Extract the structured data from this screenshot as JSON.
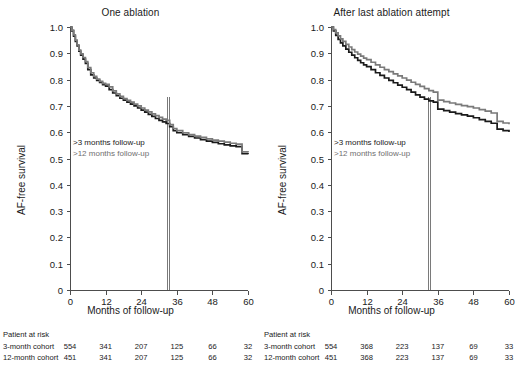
{
  "figure": {
    "width": 522,
    "height": 374,
    "background": "#ffffff",
    "series_colors": {
      "cohort_3month": "#1a1a1a",
      "cohort_12month": "#7a7a7a"
    }
  },
  "chart_data": [
    {
      "type": "line",
      "panel_id": "one-ablation",
      "title": "One ablation",
      "xlabel": "Months of follow-up",
      "ylabel": "AF-free survival",
      "xlim": [
        0,
        60
      ],
      "ylim": [
        0,
        1.0
      ],
      "grid": false,
      "legend_position": "inside-left",
      "xticks": [
        0,
        12,
        24,
        36,
        48,
        60
      ],
      "xticklabels": [
        "0",
        "12",
        "24",
        "36",
        "48",
        "60"
      ],
      "yticks": [
        0,
        0.1,
        0.2,
        0.3,
        0.4,
        0.5,
        0.6,
        0.7,
        0.8,
        0.9,
        1.0
      ],
      "yticklabels": [
        "0",
        "0.1",
        "0.2",
        "0.3",
        "0.4",
        "0.5",
        "0.6",
        "0.7",
        "0.8",
        "0.9",
        "1.0"
      ],
      "annotations": [
        {
          "label": ">3 months follow-up",
          "color": "#1a1a1a"
        },
        {
          "label": ">12 months follow-up",
          "color": "#6f6f6f"
        }
      ],
      "reference_lines": [
        {
          "x": 32.6,
          "color": "#7a7a7a"
        },
        {
          "x": 33.4,
          "color": "#7a7a7a"
        }
      ],
      "series": [
        {
          "name": ">3 months follow-up",
          "color": "#1a1a1a",
          "x": [
            0,
            0.6,
            1.2,
            1.8,
            2.4,
            3.0,
            3.6,
            4.4,
            5.2,
            6.0,
            7.0,
            8.0,
            9.0,
            10.0,
            11.0,
            12.0,
            13.2,
            14.4,
            15.6,
            16.8,
            18.0,
            19.2,
            20.4,
            21.6,
            22.8,
            24.0,
            25.2,
            26.4,
            27.6,
            28.8,
            30.0,
            31.2,
            32.4,
            33.6,
            34.8,
            36.0,
            38.0,
            40.0,
            42.0,
            44.0,
            46.0,
            48.0,
            50.0,
            52.0,
            54.0,
            56.0,
            58.0,
            60.0
          ],
          "y": [
            1.0,
            0.985,
            0.965,
            0.945,
            0.928,
            0.908,
            0.893,
            0.878,
            0.862,
            0.838,
            0.818,
            0.806,
            0.797,
            0.789,
            0.781,
            0.775,
            0.762,
            0.749,
            0.739,
            0.729,
            0.722,
            0.714,
            0.707,
            0.7,
            0.692,
            0.684,
            0.676,
            0.668,
            0.66,
            0.652,
            0.645,
            0.639,
            0.633,
            0.621,
            0.606,
            0.598,
            0.591,
            0.584,
            0.578,
            0.572,
            0.566,
            0.561,
            0.556,
            0.552,
            0.548,
            0.545,
            0.518,
            0.516
          ]
        },
        {
          "name": ">12 months follow-up",
          "color": "#7a7a7a",
          "x": [
            0,
            0.6,
            1.2,
            1.8,
            2.4,
            3.0,
            3.6,
            4.4,
            5.2,
            6.0,
            7.0,
            8.0,
            9.0,
            10.0,
            11.0,
            12.0,
            13.2,
            14.4,
            15.6,
            16.8,
            18.0,
            19.2,
            20.4,
            21.6,
            22.8,
            24.0,
            25.2,
            26.4,
            27.6,
            28.8,
            30.0,
            31.2,
            32.4,
            33.6,
            34.8,
            36.0,
            38.0,
            40.0,
            42.0,
            44.0,
            46.0,
            48.0,
            50.0,
            52.0,
            54.0,
            56.0,
            58.0,
            60.0
          ],
          "y": [
            1.0,
            0.988,
            0.97,
            0.95,
            0.932,
            0.912,
            0.898,
            0.884,
            0.868,
            0.846,
            0.826,
            0.812,
            0.802,
            0.793,
            0.786,
            0.782,
            0.772,
            0.757,
            0.746,
            0.736,
            0.728,
            0.721,
            0.714,
            0.707,
            0.7,
            0.692,
            0.684,
            0.677,
            0.67,
            0.663,
            0.656,
            0.65,
            0.645,
            0.629,
            0.614,
            0.606,
            0.598,
            0.591,
            0.585,
            0.58,
            0.575,
            0.57,
            0.566,
            0.562,
            0.558,
            0.555,
            0.525,
            0.523
          ]
        }
      ],
      "risk_table": {
        "caption": "Patient at risk",
        "row_labels": [
          "3-month cohort",
          "12-month cohort"
        ],
        "time_points": [
          0,
          12,
          24,
          36,
          48,
          60
        ],
        "rows": [
          [
            "554",
            "341",
            "207",
            "125",
            "66",
            "32"
          ],
          [
            "451",
            "341",
            "207",
            "125",
            "66",
            "32"
          ]
        ]
      }
    },
    {
      "type": "line",
      "panel_id": "after-last-ablation-attempt",
      "title": "After last ablation attempt",
      "xlabel": "Months of follow-up",
      "ylabel": "AF-free survival",
      "xlim": [
        0,
        60
      ],
      "ylim": [
        0,
        1.0
      ],
      "grid": false,
      "legend_position": "inside-left",
      "xticks": [
        0,
        12,
        24,
        36,
        48,
        60
      ],
      "xticklabels": [
        "0",
        "12",
        "24",
        "36",
        "48",
        "60"
      ],
      "yticks": [
        0,
        0.1,
        0.2,
        0.3,
        0.4,
        0.5,
        0.6,
        0.7,
        0.8,
        0.9,
        1.0
      ],
      "yticklabels": [
        "0",
        "0.1",
        "0.2",
        "0.3",
        "0.4",
        "0.5",
        "0.6",
        "0.7",
        "0.8",
        "0.9",
        "1.0"
      ],
      "annotations": [
        {
          "label": ">3 months follow-up",
          "color": "#1a1a1a"
        },
        {
          "label": ">12 months follow-up",
          "color": "#6f6f6f"
        }
      ],
      "reference_lines": [
        {
          "x": 32.6,
          "color": "#7a7a7a"
        },
        {
          "x": 33.4,
          "color": "#7a7a7a"
        }
      ],
      "series": [
        {
          "name": ">3 months follow-up",
          "color": "#1a1a1a",
          "x": [
            0,
            0.8,
            1.6,
            2.4,
            3.2,
            4.0,
            5.0,
            6.0,
            7.0,
            8.0,
            9.0,
            10.0,
            11.0,
            12.0,
            13.5,
            15.0,
            16.5,
            18.0,
            19.5,
            21.0,
            22.5,
            24.0,
            25.5,
            27.0,
            28.5,
            30.0,
            31.5,
            33.0,
            34.5,
            36.0,
            38.0,
            40.0,
            42.0,
            44.0,
            46.0,
            48.0,
            50.0,
            52.0,
            54.0,
            56.0,
            58.0,
            60.0
          ],
          "y": [
            1.0,
            0.985,
            0.968,
            0.953,
            0.94,
            0.928,
            0.916,
            0.904,
            0.893,
            0.883,
            0.873,
            0.864,
            0.856,
            0.849,
            0.838,
            0.826,
            0.816,
            0.806,
            0.797,
            0.788,
            0.779,
            0.771,
            0.762,
            0.752,
            0.742,
            0.733,
            0.726,
            0.719,
            0.714,
            0.688,
            0.682,
            0.676,
            0.671,
            0.666,
            0.661,
            0.655,
            0.648,
            0.641,
            0.634,
            0.612,
            0.606,
            0.601
          ]
        },
        {
          "name": ">12 months follow-up",
          "color": "#7a7a7a",
          "x": [
            0,
            0.8,
            1.6,
            2.4,
            3.2,
            4.0,
            5.0,
            6.0,
            7.0,
            8.0,
            9.0,
            10.0,
            11.0,
            12.0,
            13.5,
            15.0,
            16.5,
            18.0,
            19.5,
            21.0,
            22.5,
            24.0,
            25.5,
            27.0,
            28.5,
            30.0,
            31.5,
            33.0,
            34.5,
            36.0,
            38.0,
            40.0,
            42.0,
            44.0,
            46.0,
            48.0,
            50.0,
            52.0,
            54.0,
            56.0,
            58.0,
            60.0
          ],
          "y": [
            1.0,
            0.99,
            0.978,
            0.966,
            0.955,
            0.945,
            0.934,
            0.924,
            0.914,
            0.905,
            0.897,
            0.889,
            0.882,
            0.876,
            0.866,
            0.856,
            0.847,
            0.838,
            0.83,
            0.822,
            0.814,
            0.806,
            0.798,
            0.79,
            0.782,
            0.774,
            0.766,
            0.758,
            0.752,
            0.722,
            0.716,
            0.711,
            0.706,
            0.701,
            0.697,
            0.692,
            0.686,
            0.68,
            0.673,
            0.641,
            0.635,
            0.63
          ]
        }
      ],
      "risk_table": {
        "caption": "Patient at risk",
        "row_labels": [
          "3-month cohort",
          "12-month cohort"
        ],
        "time_points": [
          0,
          12,
          24,
          36,
          48,
          60
        ],
        "rows": [
          [
            "554",
            "368",
            "223",
            "137",
            "69",
            "33"
          ],
          [
            "451",
            "368",
            "223",
            "137",
            "69",
            "33"
          ]
        ]
      }
    }
  ]
}
